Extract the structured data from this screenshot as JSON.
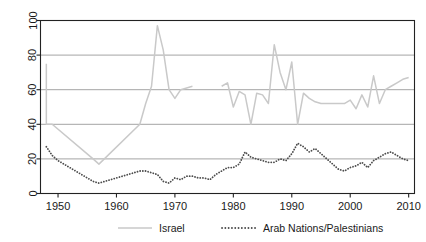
{
  "chart_data": {
    "type": "line",
    "title": "",
    "subtitle": "",
    "xlabel": "",
    "ylabel": "",
    "xlim": [
      1947,
      2011
    ],
    "ylim": [
      0,
      100
    ],
    "grid": true,
    "grid_axis": "y",
    "legend_position": "bottom",
    "xticks": [
      1950,
      1960,
      1970,
      1980,
      1990,
      2000,
      2010
    ],
    "xtick_labels": [
      "1950",
      "1960",
      "1970",
      "1980",
      "1990",
      "2000",
      "2010"
    ],
    "yticks": [
      0,
      20,
      40,
      60,
      80,
      100
    ],
    "ytick_labels": [
      "0",
      "20",
      "40",
      "60",
      "80",
      "100"
    ],
    "series": [
      {
        "name": "Israel",
        "style": "solid",
        "color": "#c9c9c9",
        "x": [
          1948,
          1948,
          1949,
          1956,
          1957,
          1964,
          1965,
          1966,
          1967,
          1968,
          1969,
          1970,
          1971,
          1972,
          1973,
          1978,
          1979,
          1980,
          1981,
          1982,
          1983,
          1984,
          1985,
          1986,
          1987,
          1988,
          1989,
          1990,
          1991,
          1992,
          1993,
          1994,
          1995,
          1996,
          1997,
          1998,
          1999,
          2000,
          2001,
          2002,
          2003,
          2004,
          2005,
          2006,
          2007,
          2008,
          2009,
          2010
        ],
        "y": [
          75,
          40,
          40,
          20,
          17,
          40,
          52,
          62,
          97,
          83,
          60,
          55,
          60,
          61,
          62,
          62,
          64,
          50,
          59,
          57,
          40,
          58,
          57,
          52,
          86,
          70,
          60,
          76,
          40,
          58,
          55,
          53,
          52,
          52,
          52,
          52,
          52,
          54,
          49,
          57,
          50,
          68,
          52,
          60,
          62,
          64,
          66,
          67
        ],
        "gaps": [
          [
            1973,
            1978
          ]
        ]
      },
      {
        "name": "Arab Nations/Palestinians",
        "style": "dotted",
        "color": "#4d4d4d",
        "x": [
          1948,
          1949,
          1950,
          1951,
          1952,
          1953,
          1954,
          1955,
          1956,
          1957,
          1958,
          1959,
          1960,
          1961,
          1962,
          1963,
          1964,
          1965,
          1966,
          1967,
          1968,
          1969,
          1970,
          1971,
          1972,
          1973,
          1974,
          1975,
          1976,
          1977,
          1978,
          1979,
          1980,
          1981,
          1982,
          1983,
          1984,
          1985,
          1986,
          1987,
          1988,
          1989,
          1990,
          1991,
          1992,
          1993,
          1994,
          1995,
          1996,
          1997,
          1998,
          1999,
          2000,
          2001,
          2002,
          2003,
          2004,
          2005,
          2006,
          2007,
          2008,
          2009,
          2010
        ],
        "y": [
          27,
          22,
          19,
          17,
          15,
          13,
          11,
          9,
          7,
          6,
          7,
          8,
          9,
          10,
          11,
          12,
          13,
          13,
          12,
          11,
          7,
          6,
          9,
          8,
          10,
          10,
          9,
          9,
          8,
          11,
          13,
          15,
          15,
          17,
          24,
          21,
          20,
          19,
          18,
          18,
          20,
          19,
          23,
          29,
          27,
          24,
          26,
          23,
          20,
          17,
          14,
          13,
          15,
          16,
          18,
          15,
          19,
          21,
          23,
          24,
          22,
          20,
          19
        ]
      }
    ],
    "legend": [
      {
        "label": "Israel",
        "style": "solid",
        "color": "#c9c9c9"
      },
      {
        "label": "Arab Nations/Palestinians",
        "style": "dotted",
        "color": "#4d4d4d"
      }
    ],
    "axis_color": "#222222",
    "gridline_color": "#9a9a9a",
    "background_color": "#ffffff"
  }
}
